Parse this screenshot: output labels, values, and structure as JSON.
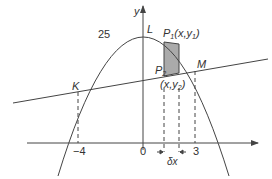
{
  "figure": {
    "type": "area between curve and line",
    "axes": {
      "x_label": "",
      "y_label": "y"
    },
    "curve": {
      "kind": "parabola",
      "max_label": "25"
    },
    "line": {
      "kind": "straight line"
    },
    "points": {
      "K": "K",
      "L": "L",
      "M": "M",
      "P1": "P",
      "P1_sub": "1",
      "P1_coord": "(x,y",
      "P1_coord_sub": "1",
      "P1_coord_close": ")",
      "P2": "P",
      "P2_sub": "2",
      "P2_coord": "(x,y",
      "P2_coord_sub": "2",
      "P2_coord_close": ")"
    },
    "ticks": {
      "left": "−4",
      "origin": "0",
      "right": "3"
    },
    "strip_width_label": "δx",
    "colors": {
      "strip_fill": "#aaaaaa",
      "stroke": "#444444"
    }
  }
}
